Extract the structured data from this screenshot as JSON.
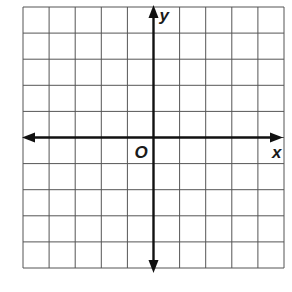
{
  "diagram": {
    "type": "coordinate-plane",
    "grid": {
      "columns": 10,
      "rows": 10,
      "left": 23,
      "top": 7,
      "cell": 26.1,
      "line_color": "#555555",
      "axis_color": "#111111"
    },
    "axes": {
      "x_label": "x",
      "y_label": "y",
      "origin_label": "O",
      "x_axis_row": 5,
      "y_axis_col": 5
    }
  }
}
